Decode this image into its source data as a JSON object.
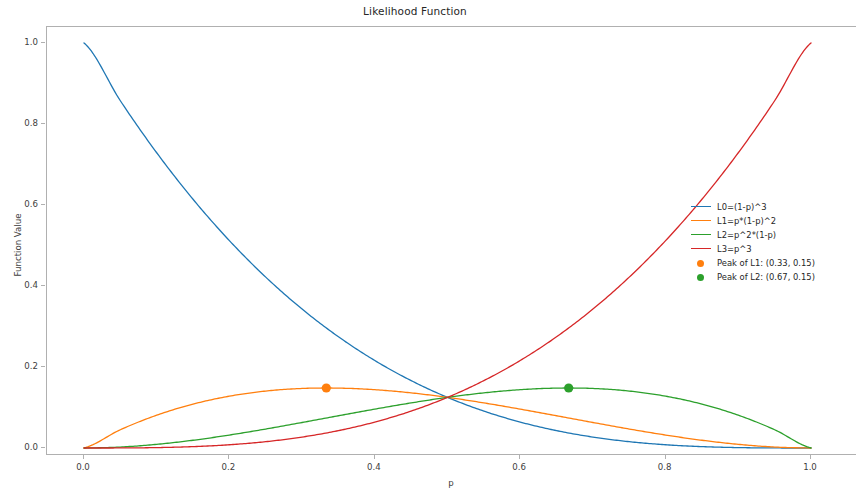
{
  "chart_data": {
    "type": "line",
    "title": "Likelihood Function",
    "xlabel": "p",
    "ylabel": "Function Value",
    "xlim": [
      0.0,
      1.0
    ],
    "ylim": [
      0.0,
      1.0
    ],
    "grid": false,
    "legend_position": "center right",
    "xticks": [
      "0.0",
      "0.2",
      "0.4",
      "0.6",
      "0.8",
      "1.0"
    ],
    "xtick_values": [
      0.0,
      0.2,
      0.4,
      0.6,
      0.8,
      1.0
    ],
    "yticks": [
      "0.0",
      "0.2",
      "0.4",
      "0.6",
      "0.8",
      "1.0"
    ],
    "ytick_values": [
      0.0,
      0.2,
      0.4,
      0.6,
      0.8,
      1.0
    ],
    "x": [
      0.0,
      0.05,
      0.1,
      0.15,
      0.2,
      0.25,
      0.3,
      0.35,
      0.4,
      0.45,
      0.5,
      0.55,
      0.6,
      0.65,
      0.7,
      0.75,
      0.8,
      0.85,
      0.9,
      0.95,
      1.0
    ],
    "series": [
      {
        "name": "L0=(1-p)^3",
        "color": "#1f77b4",
        "values": [
          1.0,
          0.857375,
          0.729,
          0.614125,
          0.512,
          0.421875,
          0.343,
          0.274625,
          0.216,
          0.166375,
          0.125,
          0.091125,
          0.064,
          0.042875,
          0.027,
          0.015625,
          0.008,
          0.003375,
          0.001,
          0.000125,
          0.0
        ]
      },
      {
        "name": "L1=p*(1-p)^2",
        "color": "#ff7f0e",
        "values": [
          0.0,
          0.045125,
          0.081,
          0.108375,
          0.128,
          0.140625,
          0.147,
          0.147875,
          0.144,
          0.136125,
          0.125,
          0.111375,
          0.096,
          0.079625,
          0.063,
          0.046875,
          0.032,
          0.019125,
          0.009,
          0.002375,
          0.0
        ]
      },
      {
        "name": "L2=p^2*(1-p)",
        "color": "#2ca02c",
        "values": [
          0.0,
          0.002375,
          0.009,
          0.019125,
          0.032,
          0.046875,
          0.063,
          0.079625,
          0.096,
          0.111375,
          0.125,
          0.136125,
          0.144,
          0.147875,
          0.147,
          0.140625,
          0.128,
          0.108375,
          0.081,
          0.045125,
          0.0
        ]
      },
      {
        "name": "L3=p^3",
        "color": "#d62728",
        "values": [
          0.0,
          0.000125,
          0.001,
          0.003375,
          0.008,
          0.015625,
          0.027,
          0.042875,
          0.064,
          0.091125,
          0.125,
          0.166375,
          0.216,
          0.274625,
          0.343,
          0.421875,
          0.512,
          0.614125,
          0.729,
          0.857375,
          1.0
        ]
      }
    ],
    "markers": [
      {
        "name": "Peak of L1: (0.33, 0.15)",
        "color": "#ff7f0e",
        "x": 0.3333,
        "y": 0.1481
      },
      {
        "name": "Peak of L2: (0.67, 0.15)",
        "color": "#2ca02c",
        "x": 0.6667,
        "y": 0.1481
      }
    ],
    "annotations": [
      "All four curves intersect at p=0.5, value=0.125"
    ]
  },
  "legend": {
    "entries": [
      {
        "label": "L0=(1-p)^3",
        "color": "#1f77b4",
        "kind": "line"
      },
      {
        "label": "L1=p*(1-p)^2",
        "color": "#ff7f0e",
        "kind": "line"
      },
      {
        "label": "L2=p^2*(1-p)",
        "color": "#2ca02c",
        "kind": "line"
      },
      {
        "label": "L3=p^3",
        "color": "#d62728",
        "kind": "line"
      },
      {
        "label": "Peak of L1: (0.33, 0.15)",
        "color": "#ff7f0e",
        "kind": "marker"
      },
      {
        "label": "Peak of L2: (0.67, 0.15)",
        "color": "#2ca02c",
        "kind": "marker"
      }
    ]
  }
}
